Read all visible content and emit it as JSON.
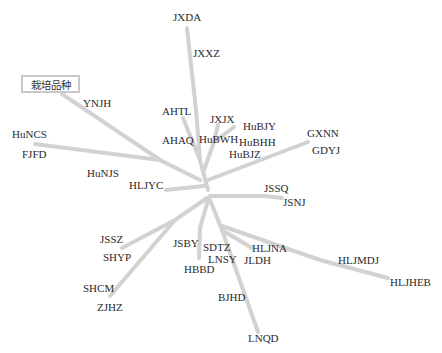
{
  "diagram": {
    "type": "unrooted-phylogenetic-tree",
    "branch_color": "#d2d2d2",
    "label_color": "#2a2a2a",
    "legend": {
      "label": "栽培品种"
    },
    "taxa": [
      {
        "id": "JXDA",
        "label": "JXDA"
      },
      {
        "id": "JXXZ",
        "label": "JXXZ"
      },
      {
        "id": "YNJH",
        "label": "YNJH"
      },
      {
        "id": "AHTL",
        "label": "AHTL"
      },
      {
        "id": "JXJX",
        "label": "JXJX"
      },
      {
        "id": "HuBJY",
        "label": "HuBJY"
      },
      {
        "id": "AHAQ",
        "label": "AHAQ"
      },
      {
        "id": "HuBWH",
        "label": "HuBWH"
      },
      {
        "id": "HuBHH",
        "label": "HuBHH"
      },
      {
        "id": "HuBJZ",
        "label": "HuBJZ"
      },
      {
        "id": "GXNN",
        "label": "GXNN"
      },
      {
        "id": "GDYJ",
        "label": "GDYJ"
      },
      {
        "id": "HuNCS",
        "label": "HuNCS"
      },
      {
        "id": "FJFD",
        "label": "FJFD"
      },
      {
        "id": "HuNJS",
        "label": "HuNJS"
      },
      {
        "id": "HLJYC",
        "label": "HLJYC"
      },
      {
        "id": "JSSQ",
        "label": "JSSQ"
      },
      {
        "id": "JSNJ",
        "label": "JSNJ"
      },
      {
        "id": "JSSZ",
        "label": "JSSZ"
      },
      {
        "id": "SHYP",
        "label": "SHYP"
      },
      {
        "id": "JSBY",
        "label": "JSBY"
      },
      {
        "id": "SDTZ",
        "label": "SDTZ"
      },
      {
        "id": "LNSY",
        "label": "LNSY"
      },
      {
        "id": "HBBD",
        "label": "HBBD"
      },
      {
        "id": "HLJNA",
        "label": "HLJNA"
      },
      {
        "id": "JLDH",
        "label": "JLDH"
      },
      {
        "id": "HLJMDJ",
        "label": "HLJMDJ"
      },
      {
        "id": "HLJHEB",
        "label": "HLJHEB"
      },
      {
        "id": "SHCM",
        "label": "SHCM"
      },
      {
        "id": "ZJHZ",
        "label": "ZJHZ"
      },
      {
        "id": "BJHD",
        "label": "BJHD"
      },
      {
        "id": "LNQD",
        "label": "LNQD"
      }
    ]
  }
}
